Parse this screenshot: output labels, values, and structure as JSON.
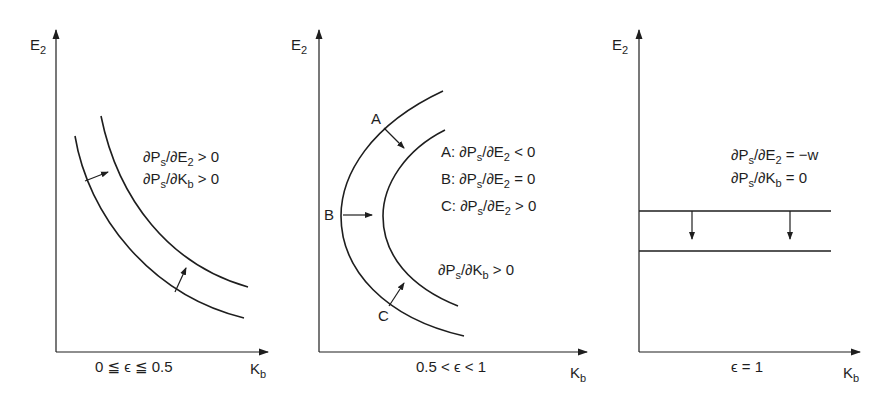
{
  "figure": {
    "panels": [
      {
        "id": "panel-1",
        "y_axis": {
          "label": "E",
          "sub": "2"
        },
        "x_axis": {
          "label": "K",
          "sub": "b"
        },
        "regime": "0 ≦ ϵ ≦ 0.5",
        "annotations": [
          {
            "pre": "∂P",
            "s": "s",
            "mid": "/∂E",
            "s2": "2",
            "post": " > 0"
          },
          {
            "pre": "∂P",
            "s": "s",
            "mid": "/∂K",
            "s2": "b",
            "post": " > 0"
          }
        ],
        "curve_type": "downward-sloping indifference curves, shift up-right"
      },
      {
        "id": "panel-2",
        "y_axis": {
          "label": "E",
          "sub": "2"
        },
        "x_axis": {
          "label": "K",
          "sub": "b"
        },
        "regime": "0.5 < ϵ < 1",
        "point_labels": [
          "A",
          "B",
          "C"
        ],
        "annotations": [
          {
            "pre": "A: ∂P",
            "s": "s",
            "mid": "/∂E",
            "s2": "2",
            "post": " < 0"
          },
          {
            "pre": "B: ∂P",
            "s": "s",
            "mid": "/∂E",
            "s2": "2",
            "post": " = 0"
          },
          {
            "pre": "C: ∂P",
            "s": "s",
            "mid": "/∂E",
            "s2": "2",
            "post": " > 0"
          },
          {
            "pre": "∂P",
            "s": "s",
            "mid": "/∂K",
            "s2": "b",
            "post": " > 0"
          }
        ],
        "curve_type": "C-shaped (backward-bending) curves, shift right"
      },
      {
        "id": "panel-3",
        "y_axis": {
          "label": "E",
          "sub": "2"
        },
        "x_axis": {
          "label": "K",
          "sub": "b"
        },
        "regime": "ϵ = 1",
        "annotations": [
          {
            "pre": "∂P",
            "s": "s",
            "mid": "/∂E",
            "s2": "2",
            "post": " = −w"
          },
          {
            "pre": "∂P",
            "s": "s",
            "mid": "/∂K",
            "s2": "b",
            "post": " = 0"
          }
        ],
        "curve_type": "horizontal lines, shift down"
      }
    ],
    "colors": {
      "ink": "#1e1e1e",
      "background": "#ffffff"
    }
  }
}
